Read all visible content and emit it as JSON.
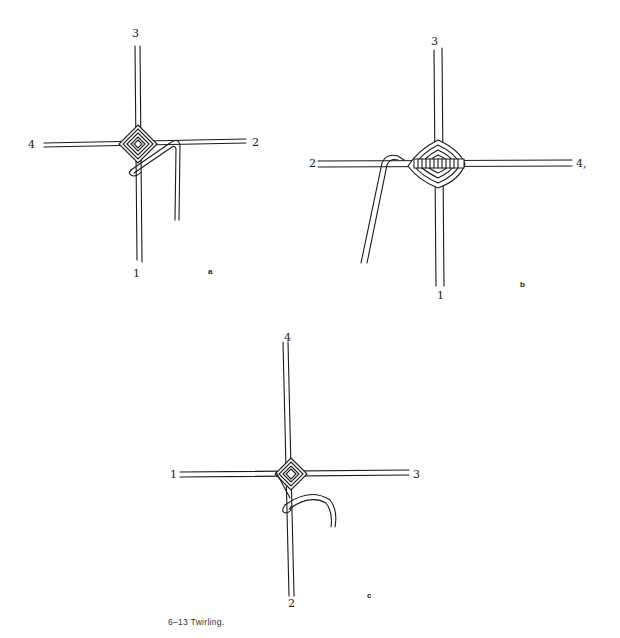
{
  "figure": {
    "caption": "6–13 Twirling."
  },
  "diagrams": [
    {
      "id": "a",
      "sublabel": "a",
      "arms": {
        "top": "3",
        "right": "2",
        "bottom": "1",
        "left": "4"
      }
    },
    {
      "id": "b",
      "sublabel": "b",
      "arms": {
        "top": "3",
        "right": "4,",
        "bottom": "1",
        "left": "2"
      }
    },
    {
      "id": "c",
      "sublabel": "c",
      "arms": {
        "top": "4",
        "right": "3",
        "bottom": "2",
        "left": "1"
      }
    }
  ]
}
